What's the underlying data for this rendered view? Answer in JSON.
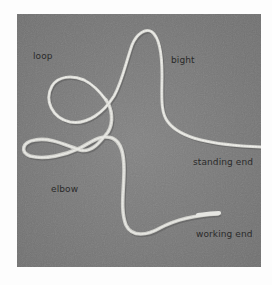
{
  "figure": {
    "background_color": "#7b7b7b",
    "rope_color": "#d9d9d4",
    "labels": [
      {
        "id": "loop",
        "text": "loop"
      },
      {
        "id": "bight",
        "text": "bight"
      },
      {
        "id": "standing-end",
        "text": "standing end"
      },
      {
        "id": "elbow",
        "text": "elbow"
      },
      {
        "id": "working-end",
        "text": "working end"
      }
    ]
  }
}
